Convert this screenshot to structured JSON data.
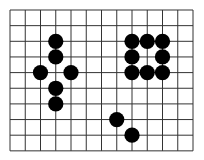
{
  "board": {
    "columns": 12,
    "rows": 9,
    "origin_x": 10,
    "origin_y": 10,
    "cell_w": 15.25,
    "cell_h": 15.65,
    "line_color": "#333333",
    "stone_color": "#000000",
    "background": "#ffffff"
  },
  "stones": [
    {
      "col": 3,
      "row": 2
    },
    {
      "col": 3,
      "row": 3
    },
    {
      "col": 2,
      "row": 4
    },
    {
      "col": 4,
      "row": 4
    },
    {
      "col": 3,
      "row": 5
    },
    {
      "col": 3,
      "row": 6
    },
    {
      "col": 8,
      "row": 2
    },
    {
      "col": 9,
      "row": 2
    },
    {
      "col": 10,
      "row": 2
    },
    {
      "col": 8,
      "row": 3
    },
    {
      "col": 10,
      "row": 3
    },
    {
      "col": 8,
      "row": 4
    },
    {
      "col": 9,
      "row": 4
    },
    {
      "col": 10,
      "row": 4
    },
    {
      "col": 7,
      "row": 7
    },
    {
      "col": 8,
      "row": 8
    }
  ]
}
